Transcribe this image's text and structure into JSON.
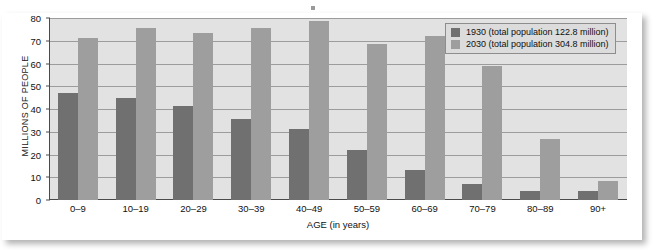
{
  "chart_data": {
    "type": "bar",
    "title": "",
    "xlabel": "AGE (in years)",
    "ylabel": "MILLIONS OF PEOPLE",
    "ylim": [
      0,
      80
    ],
    "yticks": [
      0,
      10,
      20,
      30,
      40,
      50,
      60,
      70,
      80
    ],
    "grid": true,
    "legend_position": "top-right",
    "categories": [
      "0–9",
      "10–19",
      "20–29",
      "30–39",
      "40–49",
      "50–59",
      "60–69",
      "70–79",
      "80–89",
      "90+"
    ],
    "series": [
      {
        "name": "1930 (total population 122.8 million)",
        "short_name": "1930",
        "color": "#707070",
        "values": [
          47,
          45,
          41.5,
          35.5,
          31,
          22,
          13,
          7,
          4,
          4
        ]
      },
      {
        "name": "2030 (total population 304.8 million)",
        "short_name": "2030",
        "color": "#9e9e9e",
        "values": [
          71,
          75.5,
          73.5,
          75.8,
          78.5,
          68.5,
          72.3,
          59,
          27,
          8.5
        ]
      }
    ]
  },
  "legend": {
    "entries": [
      "1930 (total population 122.8 million)",
      "2030 (total population 304.8 million)"
    ]
  },
  "colors": {
    "series_1930": "#707070",
    "series_2030": "#9e9e9e",
    "plot_background": "#e2e2e2",
    "gridline": "#9c9c9c",
    "axis": "#4a4a4a",
    "page_background": "#ffffff"
  }
}
